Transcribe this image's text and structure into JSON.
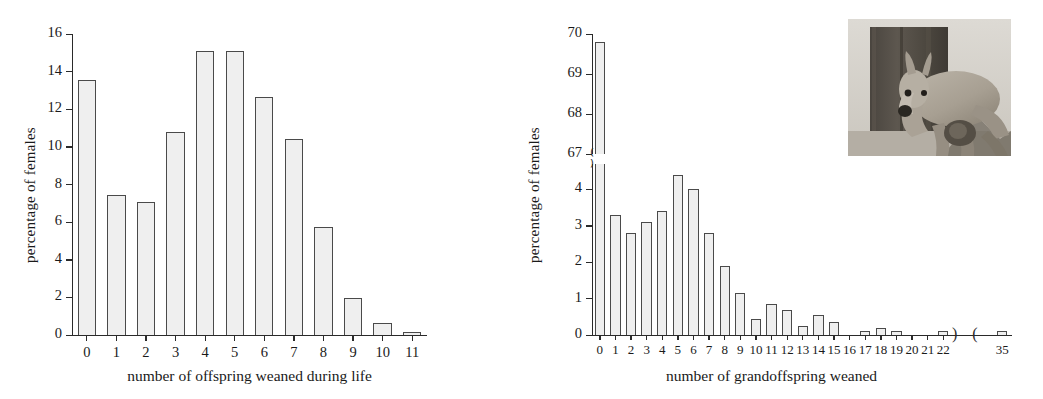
{
  "figure": {
    "panels": [
      {
        "id": "A",
        "chart_data": {
          "type": "bar",
          "title": "",
          "xlabel": "number of offspring weaned during life",
          "ylabel": "percentage of females",
          "categories": [
            "0",
            "1",
            "2",
            "3",
            "4",
            "5",
            "6",
            "7",
            "8",
            "9",
            "10",
            "11"
          ],
          "values": [
            13.55,
            7.45,
            7.05,
            10.8,
            15.1,
            15.1,
            12.65,
            10.4,
            5.75,
            1.95,
            0.65,
            0.15
          ],
          "ylim": [
            0,
            16
          ],
          "yticks": [
            "0",
            "2",
            "4",
            "6",
            "8",
            "10",
            "12",
            "14",
            "16"
          ],
          "ytickvalues": [
            0,
            2,
            4,
            6,
            8,
            10,
            12,
            14,
            16
          ],
          "grid": false,
          "legend": "none",
          "broken_axis": false
        }
      },
      {
        "id": "B",
        "chart_data": {
          "type": "bar",
          "title": "",
          "xlabel": "number of grandoffspring weaned",
          "ylabel": "percentage of females",
          "categories": [
            "0",
            "1",
            "2",
            "3",
            "4",
            "5",
            "6",
            "7",
            "8",
            "9",
            "10",
            "11",
            "12",
            "13",
            "14",
            "15",
            "16",
            "17",
            "18",
            "19",
            "20",
            "21",
            "22",
            "35"
          ],
          "values": [
            69.8,
            3.3,
            2.8,
            3.1,
            3.4,
            4.4,
            4.0,
            2.8,
            1.9,
            1.15,
            0.45,
            0.85,
            0.7,
            0.25,
            0.55,
            0.35,
            0.0,
            0.12,
            0.2,
            0.12,
            0.0,
            0.0,
            0.1,
            0.1
          ],
          "ylim_lower": [
            0,
            4.7
          ],
          "ylim_upper": [
            67,
            70
          ],
          "yticks_lower": [
            "0",
            "1",
            "2",
            "3",
            "4"
          ],
          "ytickvalues_lower": [
            0,
            1,
            2,
            3,
            4
          ],
          "yticks_upper": [
            "67",
            "68",
            "69",
            "70"
          ],
          "ytickvalues_upper": [
            67,
            68,
            69,
            70
          ],
          "grid": false,
          "legend": "none",
          "broken_axis": true,
          "x_axis_break_between": [
            "22",
            "35"
          ]
        }
      }
    ],
    "inset_photo": {
      "name": "kangaroo-photo",
      "description": "grayscale photograph of a kangaroo with joey beside a tree trunk"
    }
  }
}
